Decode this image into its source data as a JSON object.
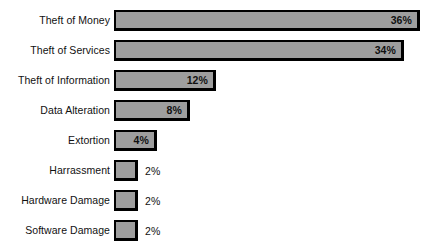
{
  "chart_data": {
    "type": "bar",
    "orientation": "horizontal",
    "title": "",
    "xlabel": "",
    "ylabel": "",
    "grid": false,
    "legend": false,
    "value_suffix": "%",
    "xlim": [
      0,
      36
    ],
    "categories": [
      "Theft of Money",
      "Theft of Services",
      "Theft of Information",
      "Data Alteration",
      "Extortion",
      "Harrassment",
      "Hardware Damage",
      "Software Damage"
    ],
    "values": [
      36,
      34,
      12,
      8,
      4,
      2,
      2,
      2
    ],
    "value_labels": [
      "36%",
      "34%",
      "12%",
      "8%",
      "4%",
      "2%",
      "2%",
      "2%"
    ],
    "label_placement": [
      "inside",
      "inside",
      "inside",
      "inside",
      "inside",
      "outside",
      "outside",
      "outside"
    ],
    "colors": {
      "bar_fill": "#9e9e9e",
      "bar_border": "#000000",
      "text": "#111111",
      "background": "#ffffff"
    }
  },
  "bars": [
    {
      "label": "Theft of Money",
      "value_label": "36%",
      "width_px": 306,
      "top_px": 10,
      "inside": true
    },
    {
      "label": "Theft of Services",
      "value_label": "34%",
      "width_px": 290,
      "top_px": 40,
      "inside": true
    },
    {
      "label": "Theft of Information",
      "value_label": "12%",
      "width_px": 102,
      "top_px": 70,
      "inside": true
    },
    {
      "label": "Data Alteration",
      "value_label": "8%",
      "width_px": 76,
      "top_px": 100,
      "inside": true
    },
    {
      "label": "Extortion",
      "value_label": "4%",
      "width_px": 43,
      "top_px": 130,
      "inside": true
    },
    {
      "label": "Harrassment",
      "value_label": "2%",
      "width_px": 24,
      "top_px": 160,
      "inside": false
    },
    {
      "label": "Hardware Damage",
      "value_label": "2%",
      "width_px": 24,
      "top_px": 190,
      "inside": false
    },
    {
      "label": "Software Damage",
      "value_label": "2%",
      "width_px": 24,
      "top_px": 220,
      "inside": false
    }
  ]
}
